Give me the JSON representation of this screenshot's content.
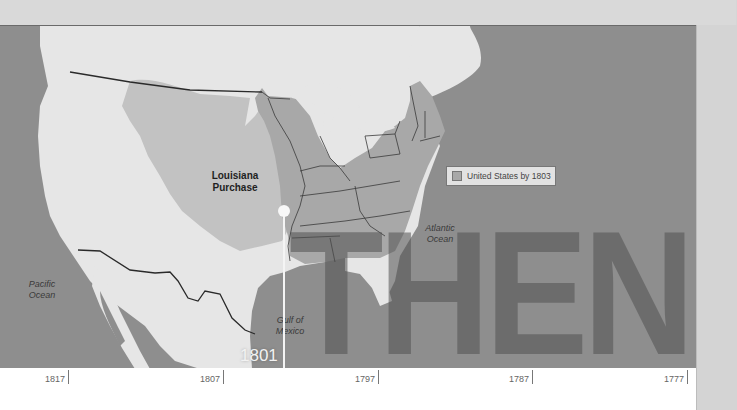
{
  "map": {
    "title_overlay": "THEN",
    "labels": {
      "louisiana_purchase": "Louisiana\nPurchase",
      "pacific_ocean": "Pacific\nOcean",
      "atlantic_ocean": "Atlantic\nOcean",
      "gulf_of_mexico": "Gulf of\nMexico"
    },
    "legend": {
      "label": "United States by 1803",
      "swatch_color": "#a8a8a8"
    },
    "colors": {
      "ocean": "#8e8e8e",
      "other_land": "#e6e6e6",
      "louisiana_purchase": "#c2c2c2",
      "united_states_1803": "#a8a8a8",
      "overlay_text": "#5a5a5a"
    }
  },
  "timeline": {
    "current_marker": {
      "year": "1801"
    },
    "ticks": [
      {
        "label": "1817"
      },
      {
        "label": "1807"
      },
      {
        "label": "1797"
      },
      {
        "label": "1787"
      },
      {
        "label": "1777"
      }
    ]
  }
}
